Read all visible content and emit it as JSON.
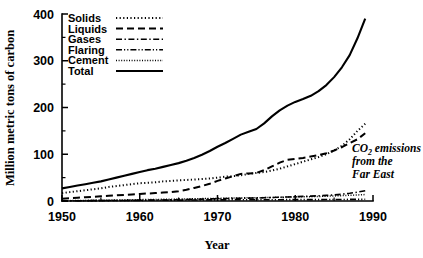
{
  "chart_data": {
    "type": "line",
    "title": "",
    "xlabel": "Year",
    "ylabel": "Million metric tons of carbon",
    "xlim": [
      1950,
      1990
    ],
    "ylim": [
      0,
      400
    ],
    "xticks": [
      1950,
      1960,
      1970,
      1980,
      1990
    ],
    "yticks": [
      0,
      100,
      200,
      300,
      400
    ],
    "xminor_step": 5,
    "yminor_step": 50,
    "grid": false,
    "legend_position": "top-left",
    "annotation": {
      "line1_pre": "CO",
      "line1_sub": "2",
      "line1_post": " emissions",
      "line2": "from the",
      "line3": "Far East"
    },
    "x": [
      1950,
      1951,
      1952,
      1953,
      1954,
      1955,
      1956,
      1957,
      1958,
      1959,
      1960,
      1961,
      1962,
      1963,
      1964,
      1965,
      1966,
      1967,
      1968,
      1969,
      1970,
      1971,
      1972,
      1973,
      1974,
      1975,
      1976,
      1977,
      1978,
      1979,
      1980,
      1981,
      1982,
      1983,
      1984,
      1985,
      1986,
      1987,
      1988,
      1989
    ],
    "series": [
      {
        "name": "Solids",
        "style": "dotted",
        "stroke_width": 2.0,
        "dasharray": "1.2,2.4",
        "values": [
          17,
          19,
          21,
          23,
          25,
          27,
          30,
          32,
          34,
          36,
          38,
          39,
          40,
          42,
          43,
          44,
          45,
          46,
          47,
          48,
          50,
          52,
          53,
          55,
          58,
          60,
          62,
          65,
          69,
          74,
          79,
          84,
          89,
          94,
          100,
          108,
          118,
          132,
          150,
          165
        ]
      },
      {
        "name": "Liquids",
        "style": "dashed",
        "stroke_width": 2.0,
        "dasharray": "7,4",
        "values": [
          5,
          6,
          7,
          8,
          9,
          10,
          11,
          12,
          13,
          14,
          15,
          16,
          17,
          18,
          19,
          21,
          24,
          28,
          32,
          37,
          43,
          48,
          53,
          58,
          59,
          60,
          66,
          74,
          82,
          88,
          90,
          92,
          95,
          98,
          102,
          108,
          115,
          124,
          132,
          145
        ]
      },
      {
        "name": "Gases",
        "style": "dash-dot",
        "stroke_width": 1.6,
        "dasharray": "6,2.5,1.4,2.5",
        "values": [
          0.3,
          0.4,
          0.5,
          0.6,
          0.7,
          0.8,
          0.9,
          1.0,
          1.2,
          1.4,
          1.6,
          1.8,
          2.0,
          2.2,
          2.5,
          2.8,
          3.2,
          3.6,
          4.0,
          4.4,
          4.8,
          5.2,
          5.6,
          6.0,
          6.2,
          6.5,
          7.0,
          7.5,
          8.0,
          8.6,
          9.2,
          9.8,
          10.4,
          11.2,
          12.0,
          13.0,
          14.5,
          16.5,
          19.0,
          22.0
        ]
      },
      {
        "name": "Flaring",
        "style": "dash-dot-dot",
        "stroke_width": 1.6,
        "dasharray": "6,2,1.2,2,1.2,2",
        "values": [
          0.4,
          0.5,
          0.6,
          0.7,
          0.8,
          0.9,
          1.0,
          1.1,
          1.2,
          1.3,
          1.4,
          1.5,
          1.6,
          1.7,
          1.8,
          1.9,
          2.0,
          2.1,
          2.2,
          2.3,
          2.4,
          2.5,
          2.6,
          2.7,
          2.6,
          2.5,
          2.6,
          2.7,
          2.8,
          2.9,
          3.0,
          3.0,
          3.0,
          3.0,
          3.1,
          3.2,
          3.3,
          3.4,
          3.5,
          3.6
        ]
      },
      {
        "name": "Cement",
        "style": "fine-dotted",
        "stroke_width": 1.5,
        "dasharray": "1,1.6",
        "values": [
          0.6,
          0.8,
          1.0,
          1.2,
          1.4,
          1.6,
          1.8,
          2.0,
          2.3,
          2.6,
          2.9,
          3.1,
          3.3,
          3.6,
          3.9,
          4.2,
          4.5,
          4.8,
          5.1,
          5.4,
          5.7,
          6.0,
          6.3,
          6.6,
          6.8,
          7.0,
          7.3,
          7.6,
          8.0,
          8.4,
          8.8,
          9.0,
          9.3,
          9.7,
          10.2,
          10.8,
          11.5,
          12.2,
          13.0,
          13.8
        ]
      },
      {
        "name": "Total",
        "style": "solid",
        "stroke_width": 2.1,
        "dasharray": "",
        "values": [
          27,
          30,
          33,
          36,
          39,
          42,
          46,
          50,
          54,
          58,
          62,
          66,
          69,
          73,
          77,
          81,
          86,
          92,
          99,
          107,
          116,
          124,
          133,
          142,
          148,
          154,
          166,
          181,
          194,
          204,
          212,
          218,
          225,
          235,
          248,
          265,
          286,
          312,
          348,
          390
        ]
      }
    ]
  },
  "legend": {
    "entries": [
      {
        "label": "Solids"
      },
      {
        "label": "Liquids"
      },
      {
        "label": "Gases"
      },
      {
        "label": "Flaring"
      },
      {
        "label": "Cement"
      },
      {
        "label": "Total"
      }
    ]
  },
  "axes": {
    "y_title": "Million metric tons of carbon",
    "x_title": "Year",
    "x_tick_labels": [
      "1950",
      "1960",
      "1970",
      "1980",
      "1990"
    ],
    "y_tick_labels": [
      "0",
      "100",
      "200",
      "300",
      "400"
    ]
  },
  "colors": {
    "ink": "#000000",
    "paper": "#ffffff"
  }
}
